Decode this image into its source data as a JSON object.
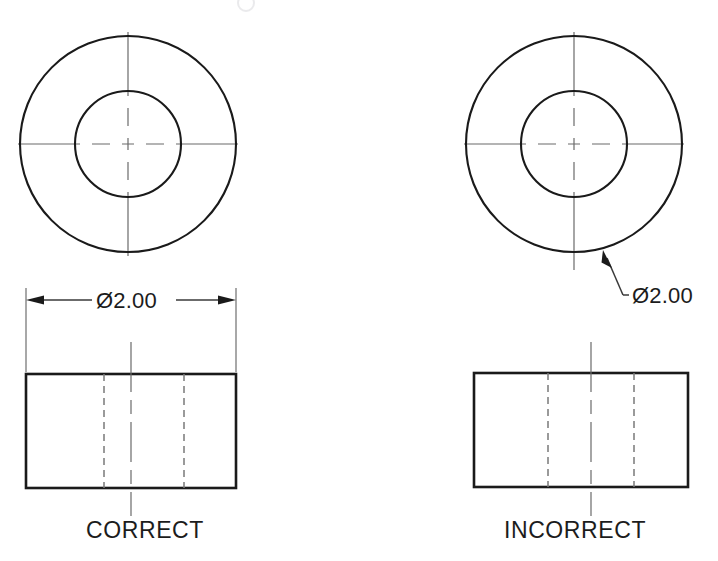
{
  "figure": {
    "title_visible": false,
    "panels": [
      {
        "id": "correct",
        "caption": "CORRECT",
        "dimension_text": "Ø2.00",
        "dimension_placement": "rectangular-side-view",
        "views": {
          "circular": {
            "outer_circle": {
              "cx": 128,
              "cy": 144,
              "r": 108
            },
            "inner_circle": {
              "cx": 128,
              "cy": 144,
              "r": 53
            },
            "centerlines": true
          },
          "rectangular": {
            "x": 26,
            "y": 374,
            "width": 210,
            "height": 114,
            "hidden_lines": [
              78,
              158
            ],
            "centerline": 131
          }
        }
      },
      {
        "id": "incorrect",
        "caption": "INCORRECT",
        "dimension_text": "Ø2.00",
        "dimension_placement": "circular-view-leader",
        "views": {
          "circular": {
            "outer_circle": {
              "cx": 574,
              "cy": 144,
              "r": 108
            },
            "inner_circle": {
              "cx": 574,
              "cy": 144,
              "r": 53
            },
            "centerlines": true
          },
          "rectangular": {
            "x": 474,
            "y": 373,
            "width": 214,
            "height": 114,
            "hidden_lines": [
              74,
              160
            ],
            "centerline": 131
          }
        }
      }
    ]
  },
  "colors": {
    "object_line": "#1a1a1a",
    "center_line": "#6b6b6b",
    "hidden_line": "#7a7a7a",
    "dimension_line": "#3a3a3a",
    "background": "#ffffff",
    "text": "#1c1c1c"
  },
  "line_types": {
    "object": "continuous-thick",
    "hidden": "dashed-thin",
    "center": "long-dash-short-dash-thin",
    "dimension": "continuous-thin-with-arrowheads",
    "leader": "continuous-thin-with-arrowhead-and-shoulder"
  }
}
